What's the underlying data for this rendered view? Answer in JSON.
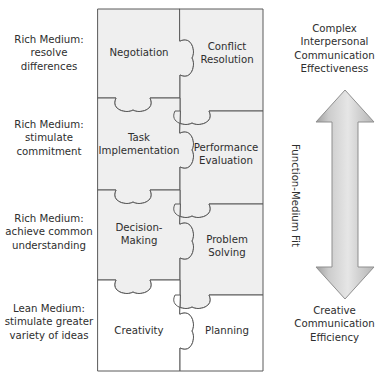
{
  "figure": {
    "colors": {
      "shaded_piece_fill": "#efefef",
      "plain_piece_fill": "#ffffff",
      "outline": "#5a5a5a",
      "text": "#2e2e2e",
      "arrow_fill_light": "#f2f2f2",
      "arrow_fill_dark": "#b8b8b8",
      "arrow_outline": "#8f8f8f"
    }
  },
  "left_labels": [
    {
      "id": "rich-resolve-differences",
      "text": "Rich Medium:\nresolve\ndifferences"
    },
    {
      "id": "rich-stimulate-commitment",
      "text": "Rich Medium:\nstimulate\ncommitment"
    },
    {
      "id": "rich-achieve-common-understanding",
      "text": "Rich Medium:\nachieve common\nunderstanding"
    },
    {
      "id": "lean-stimulate-variety",
      "text": "Lean Medium:\nstimulate greater\nvariety of ideas"
    }
  ],
  "puzzle": {
    "rows": [
      {
        "row_index": 0,
        "shaded": true,
        "pieces": [
          {
            "column": "left",
            "label": "Negotiation"
          },
          {
            "column": "right",
            "label": "Conflict\nResolution"
          }
        ]
      },
      {
        "row_index": 1,
        "shaded": true,
        "pieces": [
          {
            "column": "left",
            "label": "Task\nImplementation"
          },
          {
            "column": "right",
            "label": "Performance\nEvaluation"
          }
        ]
      },
      {
        "row_index": 2,
        "shaded": true,
        "pieces": [
          {
            "column": "left",
            "label": "Decision-\nMaking"
          },
          {
            "column": "right",
            "label": "Problem\nSolving"
          }
        ]
      },
      {
        "row_index": 3,
        "shaded": false,
        "pieces": [
          {
            "column": "left",
            "label": "Creativity"
          },
          {
            "column": "right",
            "label": "Planning"
          }
        ]
      }
    ]
  },
  "right_column": {
    "top_text": "Complex\nInterpersonal\nCommunication\nEffectiveness",
    "bottom_text": "Creative\nCommunication\nEfficiency",
    "axis_label": "Function-Medium Fit",
    "arrow": {
      "name": "double-headed-vertical-arrow",
      "direction": "up-and-down"
    }
  }
}
